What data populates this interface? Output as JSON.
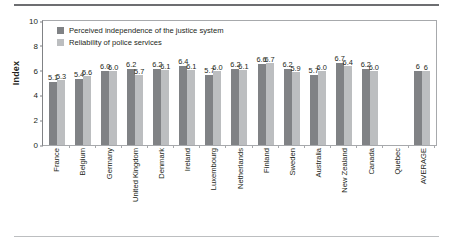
{
  "chart_data": {
    "type": "bar",
    "title": "",
    "xlabel": "",
    "ylabel": "Index",
    "ylim": [
      0,
      10
    ],
    "yticks": [
      10,
      8,
      6,
      4,
      2,
      0
    ],
    "grid": false,
    "legend_position": "top-left",
    "categories": [
      "France",
      "Belgium",
      "Germany",
      "United Kingdom",
      "Denmark",
      "Ireland",
      "Luxembourg",
      "Netherlands",
      "Finland",
      "Sweden",
      "Australia",
      "New Zealand",
      "Canada",
      "Quebec",
      "AVERAGE"
    ],
    "series": [
      {
        "name": "Perceived independence of the justice system",
        "color": "#808285",
        "values": [
          5.1,
          5.4,
          6.0,
          6.2,
          6.2,
          6.4,
          5.7,
          6.2,
          6.6,
          6.2,
          5.7,
          6.7,
          6.2,
          null,
          6
        ],
        "labels": [
          "5.1",
          "5.4",
          "6.0",
          "6.2",
          "6.2",
          "6.4",
          "5.7",
          "6.2",
          "6.6",
          "6.2",
          "5.7",
          "6.7",
          "6.2",
          "",
          "6"
        ]
      },
      {
        "name": "Reliability of police services",
        "color": "#bcbec0",
        "values": [
          5.3,
          5.6,
          6.0,
          5.7,
          6.1,
          6.1,
          6.0,
          6.1,
          6.7,
          5.9,
          6.0,
          6.4,
          6.0,
          null,
          6
        ],
        "labels": [
          "5.3",
          "5.6",
          "6.0",
          "5.7",
          "6.1",
          "6.1",
          "6.0",
          "6.1",
          "6.7",
          "5.9",
          "6.0",
          "6.4",
          "6.0",
          "",
          "6"
        ]
      }
    ]
  }
}
